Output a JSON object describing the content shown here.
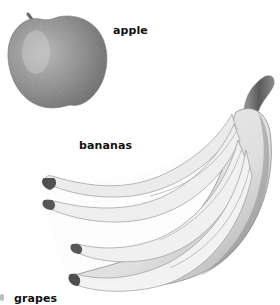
{
  "illustration": {
    "items": [
      {
        "id": "apple",
        "label": "apple"
      },
      {
        "id": "bananas",
        "label": "bananas"
      },
      {
        "id": "grapes",
        "label": "grapes"
      }
    ],
    "style": "pencil-sketch grayscale",
    "colors": {
      "background": "#ffffff",
      "label_text": "#111111",
      "sketch_dark": "#555555",
      "sketch_mid": "#9a9a9a",
      "sketch_light": "#e6e6e6"
    }
  }
}
